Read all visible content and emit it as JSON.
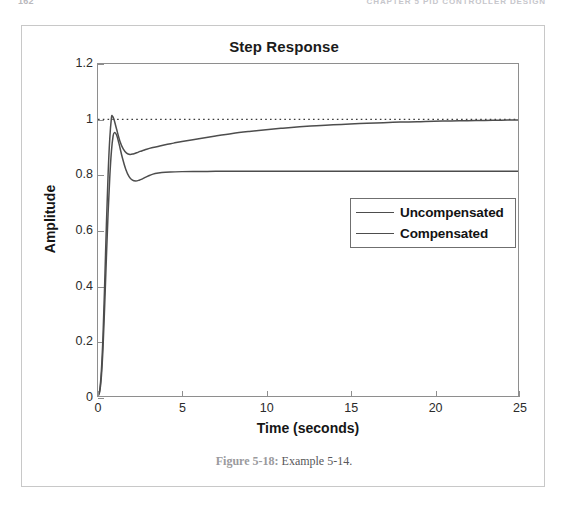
{
  "page": {
    "folio": "162",
    "running_head": "CHAPTER 5   PID CONTROLLER DESIGN"
  },
  "figure": {
    "caption_label": "Figure 5-18:",
    "caption_text": " Example 5-14."
  },
  "legend": {
    "items": [
      {
        "label": "Uncompensated",
        "color": "#4d4d4d"
      },
      {
        "label": "Compensated",
        "color": "#4d4d4d"
      }
    ]
  },
  "chart_data": {
    "type": "line",
    "title": "Step Response",
    "xlabel": "Time (seconds)",
    "ylabel": "Amplitude",
    "xlim": [
      0,
      25
    ],
    "ylim": [
      0,
      1.2
    ],
    "xticks": [
      0,
      5,
      10,
      15,
      20,
      25
    ],
    "xtick_labels": [
      "0",
      "5",
      "10",
      "15",
      "20",
      "25"
    ],
    "yticks": [
      0,
      0.2,
      0.4,
      0.6,
      0.8,
      1,
      1.2
    ],
    "ytick_labels": [
      "0",
      "0.2",
      "0.4",
      "0.6",
      "0.8",
      "1",
      "1.2"
    ],
    "grid": false,
    "legend_position": "center-right",
    "reference_line": {
      "y": 1.0,
      "style": "dotted",
      "color": "#3a3a3a"
    },
    "series": [
      {
        "name": "Uncompensated",
        "color": "#4d4d4d",
        "final_value": 1.0,
        "peak_value": 1.012,
        "peak_time": 0.85,
        "x": [
          0,
          0.1,
          0.2,
          0.3,
          0.4,
          0.5,
          0.6,
          0.7,
          0.8,
          0.85,
          0.95,
          1.1,
          1.3,
          1.5,
          1.7,
          1.9,
          2.1,
          2.3,
          2.5,
          2.7,
          2.9,
          3.2,
          3.5,
          4.0,
          4.5,
          5.0,
          6.0,
          7.0,
          8.0,
          9.0,
          10.0,
          11.0,
          12.0,
          13.0,
          14.0,
          15.0,
          16.0,
          17.0,
          18.0,
          19.0,
          20.0,
          21.0,
          22.0,
          23.0,
          24.0,
          25.0
        ],
        "y": [
          0,
          0.02,
          0.09,
          0.22,
          0.41,
          0.62,
          0.8,
          0.93,
          1.005,
          1.012,
          1.0,
          0.966,
          0.922,
          0.893,
          0.878,
          0.873,
          0.875,
          0.879,
          0.884,
          0.888,
          0.892,
          0.897,
          0.901,
          0.908,
          0.914,
          0.92,
          0.93,
          0.94,
          0.949,
          0.956,
          0.962,
          0.968,
          0.973,
          0.977,
          0.98,
          0.983,
          0.986,
          0.988,
          0.99,
          0.991,
          0.993,
          0.994,
          0.995,
          0.996,
          0.997,
          0.998
        ]
      },
      {
        "name": "Compensated",
        "color": "#4d4d4d",
        "final_value": 0.812,
        "peak_value": 0.952,
        "peak_time": 0.97,
        "x": [
          0,
          0.1,
          0.2,
          0.3,
          0.4,
          0.5,
          0.6,
          0.7,
          0.8,
          0.9,
          0.97,
          1.1,
          1.25,
          1.45,
          1.65,
          1.85,
          2.05,
          2.25,
          2.45,
          2.65,
          2.85,
          3.1,
          3.4,
          3.8,
          4.3,
          5.0,
          6.0,
          7.0,
          8.0,
          10.0,
          12.0,
          15.0,
          18.0,
          21.0,
          25.0
        ],
        "y": [
          0,
          0.015,
          0.07,
          0.175,
          0.33,
          0.5,
          0.66,
          0.79,
          0.885,
          0.94,
          0.952,
          0.944,
          0.912,
          0.861,
          0.82,
          0.793,
          0.78,
          0.777,
          0.78,
          0.785,
          0.791,
          0.798,
          0.804,
          0.808,
          0.81,
          0.811,
          0.8115,
          0.812,
          0.812,
          0.812,
          0.812,
          0.812,
          0.812,
          0.812,
          0.812
        ]
      }
    ]
  }
}
